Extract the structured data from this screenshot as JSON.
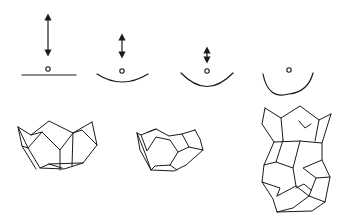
{
  "figure": {
    "stroke_color": "#1a1a1a",
    "background": "#ffffff",
    "panels": [
      {
        "id": 1,
        "arrow_length": "long",
        "surface": "flat",
        "cage": "open bowl (half cage)"
      },
      {
        "id": 2,
        "arrow_length": "medium",
        "surface": "shallow curve",
        "cage": "open bowl, more closed"
      },
      {
        "id": 3,
        "arrow_length": "short",
        "surface": "curved",
        "cage": "none"
      },
      {
        "id": 4,
        "arrow_length": "none",
        "surface": "deep curve",
        "cage": "closed cage with inner guest"
      }
    ]
  }
}
